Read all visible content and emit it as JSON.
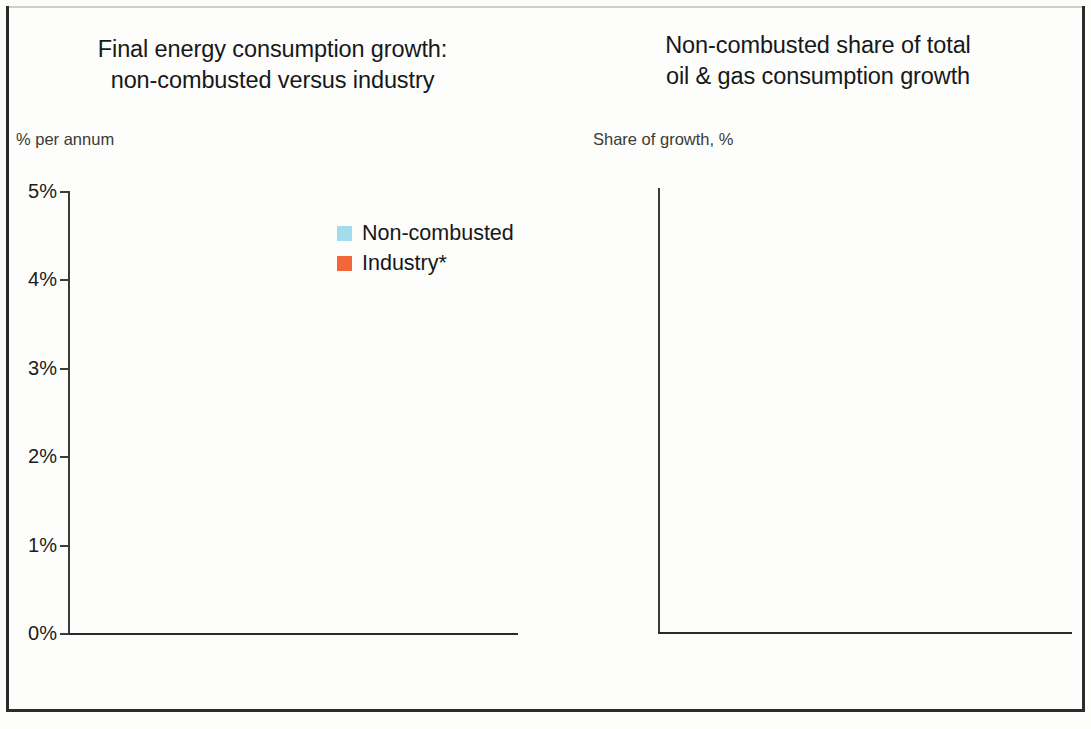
{
  "colors": {
    "non_combusted": "#a5dced",
    "industry": "#f4663a",
    "share": "#7673c0",
    "axis": "#3b3b3b",
    "text": "#17171a"
  },
  "left_panel": {
    "title_line1": "Final energy consumption growth:",
    "title_line2": "non-combusted versus industry",
    "axis_caption": "% per annum",
    "legend": [
      {
        "label": "Non-combusted",
        "color": "#a5dced"
      },
      {
        "label": "Industry*",
        "color": "#f4663a"
      }
    ]
  },
  "right_panel": {
    "title_line1": "Non-combusted share of total",
    "title_line2": "oil & gas consumption growth",
    "axis_caption": "Share of growth, %"
  },
  "chart_data": [
    {
      "type": "bar",
      "title": "Final energy consumption growth: non-combusted versus industry",
      "xlabel": "",
      "ylabel": "% per annum",
      "ylim": [
        0,
        5
      ],
      "ytick_labels": [
        "0%",
        "1%",
        "2%",
        "3%",
        "4%",
        "5%"
      ],
      "ytick_values": [
        0,
        1,
        2,
        3,
        4,
        5
      ],
      "grid": false,
      "legend_position": "inside-top-right",
      "categories": [
        "1970-\n1980",
        "1980-\n1990",
        "1990-\n2000",
        "2000-\n2010",
        "2010-\n2020",
        "2020-\n2030",
        "2030-\n2040"
      ],
      "series": [
        {
          "name": "Non-combusted",
          "color": "#a5dced",
          "values": [
            4.86,
            4.22,
            2.28,
            2.27,
            2.0,
            2.06,
            1.56
          ]
        },
        {
          "name": "Industry*",
          "color": "#f4663a",
          "values": [
            2.34,
            1.08,
            0.77,
            3.14,
            1.27,
            1.18,
            0.73
          ]
        }
      ],
      "annotations": [
        {
          "type": "vertical-dashed-divider",
          "after_category_index": 3,
          "meaning": "history / forecast split"
        }
      ]
    },
    {
      "type": "bar",
      "title": "Non-combusted share of total oil & gas consumption growth",
      "xlabel": "",
      "ylabel": "Share of growth, %",
      "ylim": [
        0,
        45
      ],
      "ytick_labels": [
        "0%",
        "5%",
        "10%",
        "15%",
        "20%",
        "25%",
        "30%",
        "35%",
        "40%",
        "45%"
      ],
      "ytick_values": [
        0,
        5,
        10,
        15,
        20,
        25,
        30,
        35,
        40,
        45
      ],
      "grid": false,
      "categories": [
        "2010-\n2015",
        "2015-\n2020",
        "2020-\n2025",
        "2025-\n2030",
        "2030-\n2035",
        "2035-\n2040"
      ],
      "series": [
        {
          "name": "Non-combusted share of growth",
          "color": "#7673c0",
          "values": [
            8.4,
            13.5,
            18.8,
            22.3,
            27.9,
            40.4
          ]
        }
      ],
      "annotations": [
        {
          "type": "vertical-dashed-divider",
          "after_category_index": 0,
          "meaning": "history / forecast split"
        }
      ]
    }
  ]
}
